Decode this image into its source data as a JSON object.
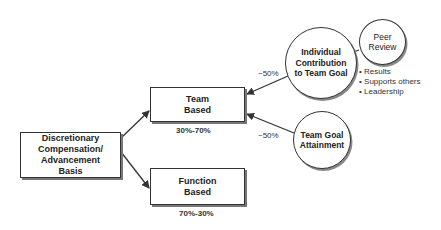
{
  "diagram": {
    "root": {
      "lines": [
        "Discretionary",
        "Compensation/",
        "Advancement",
        "Basis"
      ]
    },
    "team_based": {
      "lines": [
        "Team",
        "Based"
      ],
      "share": "30%-70%"
    },
    "function_based": {
      "lines": [
        "Function",
        "Based"
      ],
      "share": "70%-30%"
    },
    "individual_contribution": {
      "lines": [
        "Individual",
        "Contribution",
        "to Team Goal"
      ],
      "weight": "~50%"
    },
    "team_goal_attainment": {
      "lines": [
        "Team Goal",
        "Attainment"
      ],
      "weight": "~50%"
    },
    "peer_review": {
      "lines": [
        "Peer",
        "Review"
      ],
      "criteria": [
        "Results",
        "Supports others",
        "Leadership"
      ],
      "bullet": "•"
    }
  },
  "colors": {
    "stroke": "#333333",
    "shadow": "#777777",
    "background": "#ffffff"
  }
}
